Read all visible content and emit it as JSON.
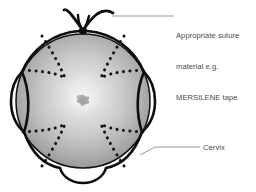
{
  "figure": {
    "kind": "medical-illustration",
    "background_color": "#ffffff"
  },
  "labels": {
    "suture": {
      "name": "suture-label",
      "line1": "Appropriate suture",
      "line2": "material e.g.",
      "line3": "MERSILENE tape",
      "text": "Appropriate suture material e.g. MERSILENE tape",
      "text_color": "#4b4b4b",
      "leader_color": "#8c8c8c"
    },
    "cervix": {
      "name": "cervix-label",
      "text": "Cervix",
      "text_color": "#4b4b4b",
      "leader_color": "#8c8c8c"
    }
  },
  "anatomy": {
    "cervix_body": {
      "name": "cervix-body",
      "center_x": 83,
      "center_y": 101,
      "radius": 67,
      "gradient_center_color": "#efefef",
      "gradient_mid_color": "#c2c2c2",
      "gradient_edge_color": "#8a8a8a",
      "outline_color": "#111111"
    },
    "external_os": {
      "name": "external-os",
      "center_x": 83,
      "center_y": 100,
      "size": 8,
      "fill_color": "#9a9a9a",
      "halo_color": "#f4f4f4"
    },
    "petal_folds": {
      "name": "dotted-fold-lines",
      "count": 4,
      "style": "dotted",
      "dot_color": "#141414",
      "dot_radius": 1.5
    }
  },
  "suture": {
    "name": "cerclage-suture",
    "color": "#0d0d0d",
    "stroke_width": 2.6,
    "loops": [
      {
        "name": "suture-loop-left",
        "position": "left"
      },
      {
        "name": "suture-loop-right",
        "position": "right"
      },
      {
        "name": "suture-loop-bottom",
        "position": "bottom"
      }
    ],
    "knot": {
      "name": "suture-knot",
      "x": 83,
      "y": 30,
      "tails": 2
    }
  }
}
